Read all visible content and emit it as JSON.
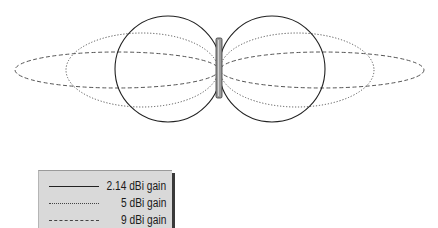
{
  "diagram": {
    "title": "",
    "antenna": {
      "x": 219,
      "top": 38,
      "bottom": 98,
      "width": 6,
      "fill": "#9e9e9e",
      "stroke": "#333333"
    },
    "patterns": [
      {
        "id": "gain-2-14",
        "label": "2.14 dBi gain",
        "style": "solid",
        "shape": "two-circles",
        "lobes": [
          {
            "cx": 168,
            "cy": 69,
            "rx": 53,
            "ry": 53
          },
          {
            "cx": 272,
            "cy": 69,
            "rx": 53,
            "ry": 53
          }
        ],
        "color": "#222222"
      },
      {
        "id": "gain-5",
        "label": "5 dBi gain",
        "style": "dotted",
        "shape": "two-lobes",
        "lobes": [
          {
            "cx": 142,
            "cy": 70,
            "rx": 76,
            "ry": 37
          },
          {
            "cx": 297,
            "cy": 70,
            "rx": 77,
            "ry": 37
          }
        ],
        "color": "#555555"
      },
      {
        "id": "gain-9",
        "label": "9 dBi gain",
        "style": "dashed",
        "shape": "two-lobes",
        "lobes": [
          {
            "cx": 117,
            "cy": 70,
            "rx": 102,
            "ry": 18
          },
          {
            "cx": 322,
            "cy": 70,
            "rx": 102,
            "ry": 18
          }
        ],
        "color": "#555555"
      }
    ]
  },
  "legend": {
    "items": [
      {
        "label": "2.14 dBi gain",
        "style": "solid"
      },
      {
        "label": "5 dBi gain",
        "style": "dotted"
      },
      {
        "label": "9 dBi gain",
        "style": "dashed"
      }
    ],
    "background": "#d9d9d9",
    "shadow": "#3a3a3a"
  }
}
